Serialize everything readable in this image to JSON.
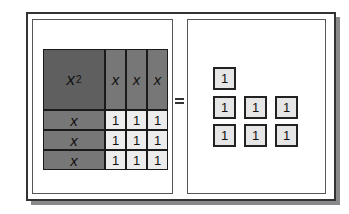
{
  "diagram": {
    "left": {
      "square": {
        "label": "x",
        "exponent": "2"
      },
      "top_strips": [
        "x",
        "x",
        "x"
      ],
      "side_strips": [
        "x",
        "x",
        "x"
      ],
      "unit_grid": [
        [
          "1",
          "1",
          "1"
        ],
        [
          "1",
          "1",
          "1"
        ],
        [
          "1",
          "1",
          "1"
        ]
      ]
    },
    "equals": "=",
    "right": {
      "tiles": [
        {
          "label": "1",
          "row": 0,
          "col": 0
        },
        {
          "label": "1",
          "row": 1,
          "col": 0
        },
        {
          "label": "1",
          "row": 1,
          "col": 1
        },
        {
          "label": "1",
          "row": 1,
          "col": 2
        },
        {
          "label": "1",
          "row": 2,
          "col": 0
        },
        {
          "label": "1",
          "row": 2,
          "col": 1
        },
        {
          "label": "1",
          "row": 2,
          "col": 2
        }
      ]
    },
    "colors": {
      "square": "#5f5f5f",
      "strip": "#777777",
      "unit": "#ececec",
      "border": "#1a1a1a"
    }
  }
}
